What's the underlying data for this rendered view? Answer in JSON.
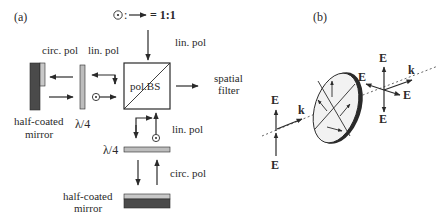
{
  "panel_a": {
    "label": "(a)",
    "ratio_legend": {
      "symbol": "⊙",
      "colon": ":",
      "equals": "= 1:1"
    },
    "beam_splitter_label": "pol.BS",
    "top_input_label": "lin. pol",
    "left_arm": {
      "circ_label": "circ. pol",
      "lin_label": "lin. pol",
      "waveplate_label": "λ/4",
      "mirror_label_line1": "half-coated",
      "mirror_label_line2": "mirror"
    },
    "bottom_arm": {
      "lin_label": "lin. pol",
      "waveplate_label": "λ/4",
      "circ_label": "circ. pol",
      "mirror_label_line1": "half-coated",
      "mirror_label_line2": "mirror"
    },
    "output": {
      "line1": "spatial",
      "line2": "filter"
    }
  },
  "panel_b": {
    "label": "(b)",
    "left_field_top": "E",
    "left_field_bottom": "E",
    "left_wavevector": "k",
    "right_field_top": "E",
    "right_field_left": "E",
    "right_field_right": "E",
    "right_field_bottom": "E",
    "right_wavevector": "k"
  },
  "colors": {
    "ink": "#2a2a2a",
    "waveplate": "#bdbdbd",
    "mirror_dark": "#4a4a4a",
    "mirror_coat": "#c8c8c8",
    "disk_face": "#f2f2f2"
  }
}
